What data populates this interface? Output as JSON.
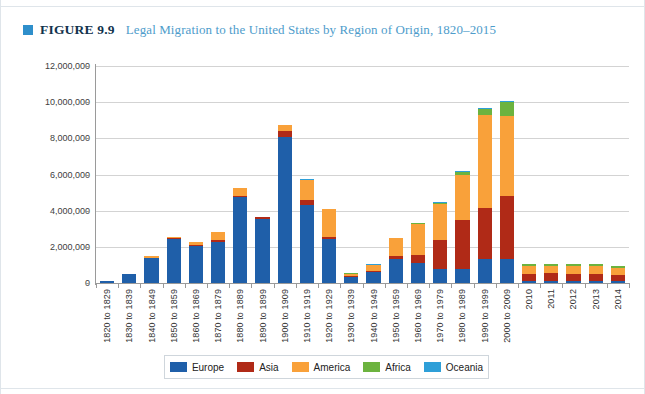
{
  "figure": {
    "marker_color": "#2e8fcb",
    "number": "FIGURE 9.9",
    "title": "Legal Migration to the United States by Region of Origin, 1820–2015"
  },
  "legend": {
    "position": "bottom-center",
    "items": [
      {
        "label": "Europe",
        "color": "#1f5fa9"
      },
      {
        "label": "Asia",
        "color": "#b02a17"
      },
      {
        "label": "America",
        "color": "#f9a13a"
      },
      {
        "label": "Africa",
        "color": "#6cb33f"
      },
      {
        "label": "Oceania",
        "color": "#2e9fd8"
      }
    ]
  },
  "axis": {
    "y_ticks": [
      "0",
      "2,000,000",
      "4,000,000",
      "6,000,000",
      "8,000,000",
      "10,000,000",
      "12,000,000"
    ],
    "y_tick_values": [
      0,
      2000000,
      4000000,
      6000000,
      8000000,
      10000000,
      12000000
    ]
  },
  "chart_data": {
    "type": "bar",
    "stacked": true,
    "title": "Legal Migration to the United States by Region of Origin, 1820–2015",
    "xlabel": "",
    "ylabel": "",
    "ylim": [
      0,
      12000000
    ],
    "grid": true,
    "legend_position": "bottom-center",
    "categories": [
      "1820 to 1829",
      "1830 to 1839",
      "1840 to 1849",
      "1850 to 1859",
      "1860 to 1869",
      "1870 to 1879",
      "1880 to 1889",
      "1890 to 1899",
      "1900 to 1909",
      "1910 to 1919",
      "1920 to 1929",
      "1930 to 1939",
      "1940 to 1949",
      "1950 to 1959",
      "1960 to 1969",
      "1970 to 1979",
      "1980 to 1989",
      "1990 to 1999",
      "2000 to 2009",
      "2010",
      "2011",
      "2012",
      "2013",
      "2014"
    ],
    "series": [
      {
        "name": "Europe",
        "color": "#1f5fa9",
        "values": [
          100000,
          480000,
          1400000,
          2450000,
          2060000,
          2270000,
          4740000,
          3560000,
          8060000,
          4320000,
          2460000,
          350000,
          620000,
          1330000,
          1120000,
          800000,
          760000,
          1350000,
          1350000,
          95000,
          90000,
          86000,
          99000,
          92000
        ]
      },
      {
        "name": "Asia",
        "color": "#b02a17",
        "values": [
          0,
          0,
          0,
          42000,
          65000,
          124000,
          70000,
          75000,
          324000,
          247000,
          112000,
          16000,
          37000,
          153000,
          428000,
          1588000,
          2738000,
          2795000,
          3470000,
          410000,
          440000,
          430000,
          400000,
          365000
        ]
      },
      {
        "name": "America",
        "color": "#f9a13a",
        "values": [
          10000,
          35000,
          75000,
          75000,
          170000,
          404000,
          427000,
          39000,
          362000,
          1144000,
          1517000,
          160000,
          355000,
          997000,
          1717000,
          1983000,
          2493000,
          5137000,
          4442000,
          425000,
          415000,
          410000,
          450000,
          400000
        ]
      },
      {
        "name": "Africa",
        "color": "#6cb33f",
        "values": [
          0,
          0,
          0,
          0,
          0,
          0,
          0,
          0,
          7000,
          8000,
          6000,
          2000,
          7000,
          14000,
          29000,
          80000,
          176000,
          355000,
          759000,
          98000,
          100000,
          107000,
          98000,
          98000
        ]
      },
      {
        "name": "Oceania",
        "color": "#2e9fd8",
        "values": [
          0,
          0,
          0,
          0,
          0,
          0,
          0,
          0,
          13000,
          13000,
          9000,
          2000,
          14000,
          12000,
          25000,
          41000,
          46000,
          56000,
          65000,
          6000,
          6000,
          6000,
          6000,
          6000
        ]
      }
    ]
  }
}
